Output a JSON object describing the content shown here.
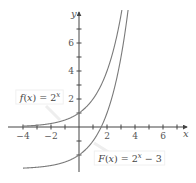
{
  "chart_data": {
    "type": "line",
    "title": "",
    "xlabel": "x",
    "ylabel": "y",
    "xlim": [
      -5,
      7.5
    ],
    "ylim": [
      -3.1,
      8.1
    ],
    "grid": false,
    "x_ticks": [
      -4,
      -3,
      -2,
      -1,
      0,
      1,
      2,
      3,
      4,
      5,
      6,
      7
    ],
    "x_tick_labels": [
      "-4",
      "-2",
      "2",
      "4",
      "6"
    ],
    "x_tick_label_values": [
      -4,
      -2,
      2,
      4,
      6
    ],
    "y_ticks": [
      -2,
      -1,
      1,
      2,
      3,
      4,
      5,
      6,
      7
    ],
    "y_tick_labels": [
      "2",
      "4",
      "6"
    ],
    "y_tick_label_values": [
      2,
      4,
      6
    ],
    "series": [
      {
        "name": "f(x) = 2^x",
        "label_parts": {
          "fn": "f",
          "arg": "(x)",
          "eq": " = 2",
          "exp": "x",
          "tail": ""
        },
        "expr": "2^x",
        "base": 2,
        "shift": 0,
        "x_start": -4,
        "points": [
          [
            -4,
            0.0625
          ],
          [
            -2,
            0.25
          ],
          [
            0,
            1
          ],
          [
            1,
            2
          ],
          [
            2,
            4
          ],
          [
            3,
            8
          ]
        ],
        "color": "#7a7a7a",
        "label_pos": [
          40,
          101
        ]
      },
      {
        "name": "F(x) = 2^x - 3",
        "label_parts": {
          "fn": "F",
          "arg": "(x)",
          "eq": " = 2",
          "exp": "x",
          "tail": " − 3"
        },
        "expr": "2^x - 3",
        "base": 2,
        "shift": -3,
        "x_start": -4,
        "points": [
          [
            -4,
            -2.9375
          ],
          [
            -2,
            -2.75
          ],
          [
            0,
            -2
          ],
          [
            1,
            -1
          ],
          [
            1.585,
            0
          ],
          [
            2,
            1
          ],
          [
            3,
            5
          ],
          [
            3.46,
            8
          ]
        ],
        "color": "#7a7a7a",
        "label_pos": [
          130,
          162
        ]
      }
    ],
    "annotations": [
      {
        "text": "f(x) = 2^x",
        "points_to": "upper curve"
      },
      {
        "text": "F(x) = 2^x − 3",
        "points_to": "lower curve"
      }
    ],
    "legend": "inline labels"
  },
  "layout": {
    "origin_px": [
      79,
      127
    ],
    "unit_px": 14,
    "x_axis_px": [
      8,
      187
    ],
    "y_axis_px": [
      12,
      172
    ],
    "axis_color": "#444444",
    "curve_color": "#7a7a7a"
  }
}
